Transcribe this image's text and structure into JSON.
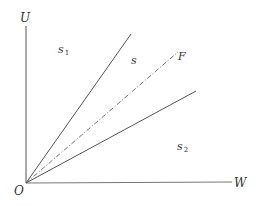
{
  "diagram": {
    "axes": {
      "vertical_label": "U",
      "horizontal_label": "W",
      "origin_label": "O"
    },
    "lines": [
      {
        "name": "upper-boundary",
        "style": "solid",
        "label": ""
      },
      {
        "name": "F-ray",
        "style": "dash-dot",
        "label": "F"
      },
      {
        "name": "lower-boundary",
        "style": "solid",
        "label": ""
      }
    ],
    "regions": {
      "s1": {
        "base": "s",
        "sub": "1"
      },
      "s": {
        "base": "s",
        "sub": ""
      },
      "s2": {
        "base": "s",
        "sub": "2"
      }
    },
    "colors": {
      "line": "#555555",
      "text": "#333333",
      "background": "#ffffff"
    }
  }
}
